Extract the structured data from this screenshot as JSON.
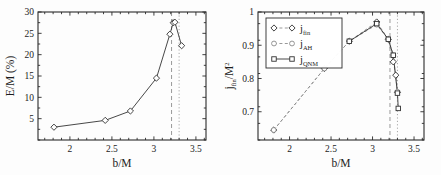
{
  "figure": {
    "panel_count": 2,
    "background_color": "#ffffff",
    "line_color": "#333333",
    "reference_line_color": "#9a9a9a"
  },
  "chart_data": [
    {
      "id": "left-panel",
      "type": "line",
      "title": "",
      "xlabel": "b/M",
      "ylabel": "E/M (%)",
      "xlim": [
        1.62,
        3.62
      ],
      "ylim": [
        0,
        30
      ],
      "xticks": [
        2,
        2.5,
        3,
        3.5
      ],
      "xtick_labels": [
        "2",
        "2.5",
        "3",
        "3.5"
      ],
      "yticks": [
        5,
        10,
        15,
        20,
        25,
        30
      ],
      "ytick_labels": [
        "5",
        "10",
        "15",
        "20",
        "25",
        "30"
      ],
      "grid": false,
      "legend": "none",
      "marker": "diamond",
      "linestyle": "solid",
      "x": [
        1.81,
        2.42,
        2.72,
        3.03,
        3.19,
        3.23,
        3.25,
        3.33
      ],
      "y": [
        3.0,
        4.6,
        6.8,
        14.5,
        24.8,
        27.5,
        27.6,
        22.1
      ],
      "annotations": [
        {
          "name": "dashed-reference-line",
          "type": "vline",
          "x": 3.21,
          "style": "dashed"
        },
        {
          "name": "dotted-reference-line",
          "type": "vline",
          "x": 3.3,
          "style": "dotted"
        }
      ]
    },
    {
      "id": "right-panel",
      "type": "line",
      "title": "",
      "xlabel": "b/M",
      "ylabel": "j_fin/M^2",
      "ylabel_parts": {
        "base": "j",
        "sub": "fin",
        "div": "/M",
        "sup": "2"
      },
      "xlim": [
        1.62,
        3.62
      ],
      "ylim": [
        0.615,
        1.0
      ],
      "xticks": [
        2,
        2.5,
        3,
        3.5
      ],
      "xtick_labels": [
        "2",
        "2.5",
        "3",
        "3.5"
      ],
      "yticks": [
        0.7,
        0.8,
        0.9,
        1.0
      ],
      "ytick_labels": [
        "0.7",
        "0.8",
        "0.9",
        "1"
      ],
      "grid": false,
      "legend": "upper-left",
      "series": [
        {
          "name": "j_fin",
          "label_base": "j",
          "label_sub": "fin",
          "marker": "diamond",
          "linestyle": "dashed",
          "x": [
            1.81,
            2.42,
            2.72,
            3.05,
            3.19,
            3.25,
            3.28,
            3.3
          ],
          "values": [
            0.645,
            0.83,
            0.912,
            0.97,
            0.918,
            0.85,
            0.81,
            0.758
          ]
        },
        {
          "name": "j_AH",
          "label_base": "j",
          "label_sub": "AH",
          "marker": "circle",
          "linestyle": "dashed",
          "x": [
            1.81,
            2.42,
            2.72,
            3.05,
            3.19,
            3.25,
            3.3
          ],
          "values": [
            0.645,
            0.83,
            0.912,
            0.962,
            0.918,
            0.87,
            0.76
          ]
        },
        {
          "name": "j_QNM",
          "label_base": "j",
          "label_sub": "QNM",
          "marker": "square",
          "linestyle": "solid",
          "x": [
            2.72,
            3.05,
            3.19,
            3.25,
            3.3,
            3.31
          ],
          "values": [
            0.912,
            0.965,
            0.918,
            0.87,
            0.756,
            0.71
          ]
        }
      ],
      "annotations": [
        {
          "name": "dashed-reference-line",
          "type": "vline",
          "x": 3.21,
          "style": "dashed"
        },
        {
          "name": "dotted-reference-line",
          "type": "vline",
          "x": 3.3,
          "style": "dotted"
        }
      ]
    }
  ]
}
